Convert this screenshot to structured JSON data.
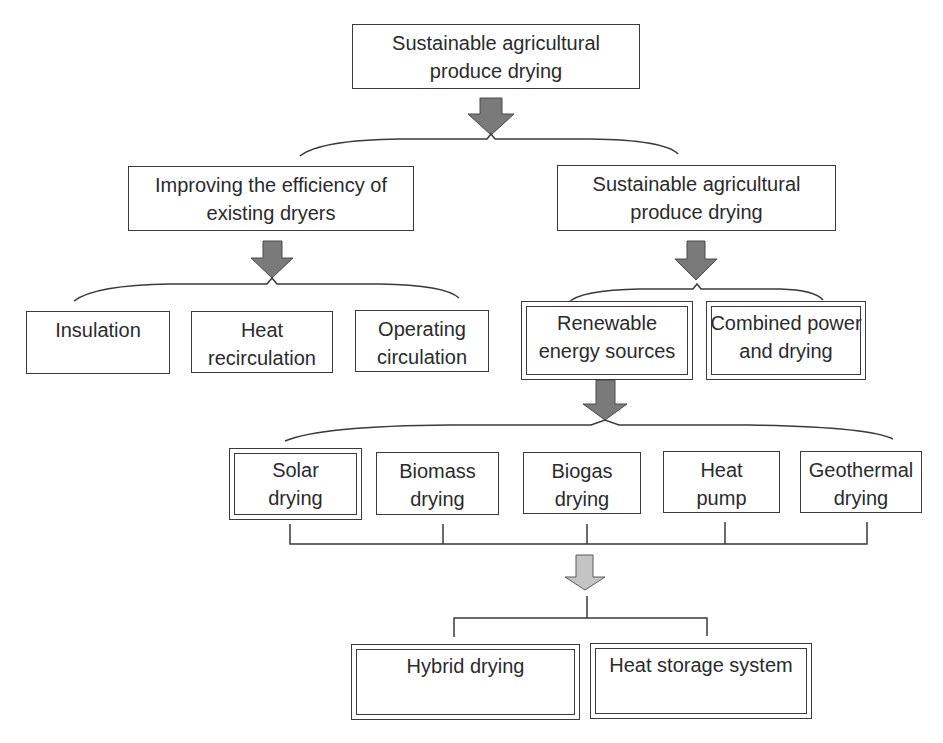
{
  "diagram": {
    "title": "Sustainable agricultural produce drying",
    "root": {
      "lines": [
        "Sustainable agricultural",
        "produce drying"
      ]
    },
    "level1": [
      {
        "id": "improving",
        "lines": [
          "Improving the efficiency of",
          "existing dryers"
        ]
      },
      {
        "id": "sustainable",
        "lines": [
          "Sustainable agricultural",
          "produce drying"
        ]
      }
    ],
    "level2_left": [
      {
        "id": "insulation",
        "lines": [
          "Insulation"
        ]
      },
      {
        "id": "heat-recirculation",
        "lines": [
          "Heat",
          "recirculation"
        ]
      },
      {
        "id": "operating-circulation",
        "lines": [
          "Operating",
          "circulation"
        ]
      }
    ],
    "level2_right": [
      {
        "id": "renewable",
        "lines": [
          "Renewable",
          "energy sources"
        ],
        "highlighted": true
      },
      {
        "id": "combined",
        "lines": [
          "Combined power",
          "and drying"
        ],
        "highlighted": true
      }
    ],
    "level3": [
      {
        "id": "solar",
        "lines": [
          "Solar",
          "drying"
        ],
        "highlighted": true
      },
      {
        "id": "biomass",
        "lines": [
          "Biomass",
          "drying"
        ]
      },
      {
        "id": "biogas",
        "lines": [
          "Biogas",
          "drying"
        ]
      },
      {
        "id": "heat-pump",
        "lines": [
          "Heat",
          "pump"
        ]
      },
      {
        "id": "geothermal",
        "lines": [
          "Geothermal",
          "drying"
        ]
      }
    ],
    "level4": [
      {
        "id": "hybrid",
        "lines": [
          "Hybrid drying"
        ],
        "highlighted": true
      },
      {
        "id": "heat-storage",
        "lines": [
          "Heat storage system"
        ],
        "highlighted": true
      }
    ],
    "colors": {
      "arrow_dark": "#7a7a7a",
      "arrow_light": "#c4c4c4",
      "stroke": "#3a3a3a",
      "text": "#2b2b2b",
      "background": "#ffffff"
    }
  }
}
